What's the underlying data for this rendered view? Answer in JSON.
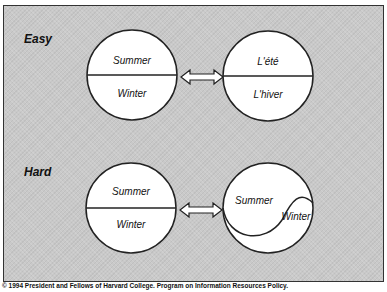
{
  "sections": [
    {
      "label": "Easy",
      "left_circle": {
        "top": "Summer",
        "bottom": "Winter"
      },
      "right_circle": {
        "top": "L'été",
        "bottom": "L'hiver"
      }
    },
    {
      "label": "Hard",
      "left_circle": {
        "top": "Summer",
        "bottom": "Winter"
      },
      "right_circle": {
        "left": "Summer",
        "right": "Winter"
      }
    }
  ],
  "caption": "© 1994 President and Fellows of Harvard College. Program on Information Resources Policy.",
  "colors": {
    "background": "#c9c9c9",
    "circle_fill": "#ffffff",
    "stroke": "#222222"
  }
}
